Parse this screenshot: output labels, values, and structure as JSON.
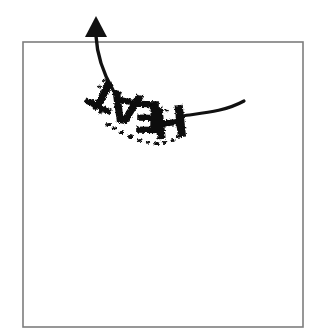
{
  "image": {
    "title": "HEAT rising arrow illustration",
    "width": 327,
    "height": 334,
    "background_color": "#ffffff"
  },
  "frame": {
    "label": "border-frame",
    "x": 23,
    "y": 42,
    "width": 280,
    "height": 285,
    "stroke_color": "#7d7d7d",
    "stroke_width": 1.6
  },
  "arrow": {
    "label": "curved-up-arrow",
    "color": "#111111",
    "direction": "up",
    "head": {
      "tip_x": 96,
      "tip_y": 16,
      "base_y": 37,
      "half_width": 11
    },
    "shaft_stroke_width": 3.4,
    "tail_stroke_width": 3.2,
    "left_tail_end_x": 113,
    "left_tail_end_y": 90,
    "right_tail_end_x": 244,
    "right_tail_end_y": 101
  },
  "wordmark": {
    "label": "heat-wordmark",
    "text": "HEAT",
    "color": "#111111",
    "rotation_degrees": 180,
    "arrangement": "arc",
    "style": "rough grunge condensed bold",
    "letters": [
      {
        "char": "T",
        "x": 105,
        "y": 92,
        "size": 42,
        "rotate": 206
      },
      {
        "char": "A",
        "x": 126,
        "y": 104,
        "size": 43,
        "rotate": 192
      },
      {
        "char": "E",
        "x": 148,
        "y": 113,
        "size": 44,
        "rotate": 181
      },
      {
        "char": "H",
        "x": 170,
        "y": 118,
        "size": 44,
        "rotate": 174
      }
    ]
  }
}
